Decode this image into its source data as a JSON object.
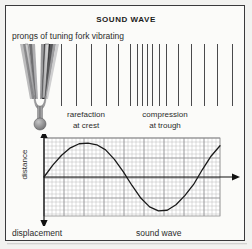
{
  "title": "SOUND WAVE",
  "captions": {
    "prongs": "prongs of tuning fork vibrating",
    "rarefaction_line1": "rarefaction",
    "rarefaction_line2": "at crest",
    "compression_line1": "compression",
    "compression_line2": "at trough",
    "displacement": "displacement",
    "sound_wave": "sound wave"
  },
  "graph": {
    "ylabel": "distance",
    "xlabel": "displacement",
    "curve_label": "sound wave"
  },
  "colors": {
    "background": "#f2f2f0",
    "panel": "#fbfbf9",
    "frame": "#3a3a3c",
    "ink": "#2b2b2b",
    "wave_line": "#4a4a4c",
    "grid_minor": "#b9b9bb",
    "grid_major": "#8e8e90",
    "curve": "#1a1a1a",
    "fork_body": "#8d8d8f",
    "fork_dark": "#2a2a2c"
  },
  "wave_lines_x": [
    55,
    70,
    85,
    100,
    112,
    124,
    131,
    136,
    141,
    146,
    153,
    160,
    172,
    185,
    198,
    211,
    226
  ],
  "chart_data": {
    "type": "line",
    "title": "",
    "xlabel": "displacement",
    "ylabel": "distance",
    "annotation": "sound wave",
    "grid": true,
    "xlim": [
      0,
      1
    ],
    "ylim": [
      -1.15,
      1.15
    ],
    "x": [
      0.0,
      0.05,
      0.1,
      0.15,
      0.2,
      0.25,
      0.3,
      0.35,
      0.4,
      0.45,
      0.5,
      0.55,
      0.6,
      0.65,
      0.7,
      0.75,
      0.8,
      0.85,
      0.9,
      0.95,
      1.0
    ],
    "y": [
      0.0,
      0.35,
      0.64,
      0.86,
      0.98,
      1.0,
      0.95,
      0.8,
      0.52,
      0.16,
      -0.25,
      -0.62,
      -0.88,
      -1.0,
      -0.98,
      -0.82,
      -0.55,
      -0.22,
      0.22,
      0.62,
      0.92
    ]
  }
}
